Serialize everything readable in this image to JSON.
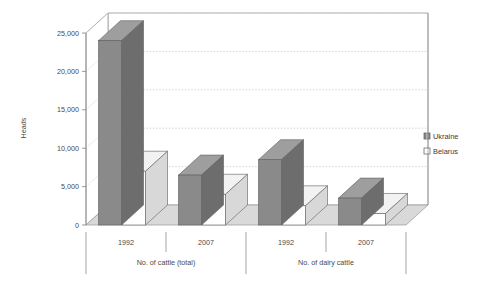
{
  "chart_data": {
    "type": "bar",
    "title": "",
    "xlabel": "",
    "ylabel": "Heads",
    "ylim": [
      0,
      25000
    ],
    "yticks": [
      0,
      5000,
      10000,
      15000,
      20000,
      25000
    ],
    "ytick_labels": [
      "0",
      "5,000",
      "10,000",
      "15,000",
      "20,000",
      "25,000"
    ],
    "grid": true,
    "grid_axis": "y",
    "legend_position": "right",
    "three_d": true,
    "categories": [
      "1992",
      "2007",
      "1992",
      "2007"
    ],
    "group_labels": [
      "No. of cattle (total)",
      "No. of dairy cattle"
    ],
    "groups": [
      {
        "label": "No. of cattle (total)",
        "categories": [
          "1992",
          "2007"
        ]
      },
      {
        "label": "No. of dairy cattle",
        "categories": [
          "1992",
          "2007"
        ]
      }
    ],
    "series": [
      {
        "name": "Ukraine",
        "color": "#8a8a8a",
        "values": [
          24000,
          6500,
          8500,
          3500
        ]
      },
      {
        "name": "Belarus",
        "color": "#ffffff",
        "values": [
          7000,
          4000,
          2500,
          1500
        ]
      }
    ]
  },
  "axis": {
    "y_title": "Heads"
  },
  "legend": {
    "items": [
      {
        "label": "Ukraine",
        "swatch": "filled"
      },
      {
        "label": "Belarus",
        "swatch": "empty"
      }
    ]
  },
  "colors": {
    "ukraine_front": "#8a8a8a",
    "ukraine_side": "#6d6d6d",
    "ukraine_top": "#9e9e9e",
    "belarus_front": "#ffffff",
    "belarus_side": "#d8d8d8",
    "belarus_top": "#f2f2f2",
    "floor": "#d9d9d9",
    "floor_edge": "#9a9a9a",
    "wall": "#ffffff",
    "grid": "#c9c9c9",
    "axis": "#8d8d8d",
    "text": "#4a4a4a"
  }
}
